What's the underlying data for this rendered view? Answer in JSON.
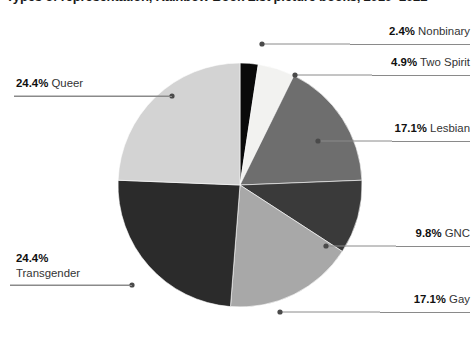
{
  "chart_data": {
    "type": "pie",
    "title": "Types of representation, Rainbow Book List picture books, 2010–2022",
    "xlabel": "",
    "ylabel": "",
    "legend_position": "none",
    "grid": false,
    "units": "percent",
    "start_angle_deg": 0,
    "direction": "clockwise",
    "categories": [
      "Nonbinary",
      "Two Spirit",
      "Lesbian",
      "GNC",
      "Gay",
      "Transgender",
      "Queer"
    ],
    "values": [
      2.4,
      4.9,
      17.1,
      9.8,
      17.1,
      24.4,
      24.4
    ],
    "labels": [
      "2.4% Nonbinary",
      "4.9% Two Spirit",
      "17.1% Lesbian",
      "9.8% GNC",
      "17.1% Gay",
      "24.4% Transgender",
      "24.4% Queer"
    ],
    "colors": [
      "#0a0a0a",
      "#f2f2f0",
      "#6e6e6e",
      "#3a3a3a",
      "#a8a8a8",
      "#2b2b2b",
      "#d3d3d3"
    ],
    "slices": [
      {
        "name": "Nonbinary",
        "percent": "2.4%",
        "label": "Nonbinary",
        "value": 2.4,
        "color": "#0a0a0a"
      },
      {
        "name": "Two Spirit",
        "percent": "4.9%",
        "label": "Two Spirit",
        "value": 4.9,
        "color": "#f2f2f0"
      },
      {
        "name": "Lesbian",
        "percent": "17.1%",
        "label": "Lesbian",
        "value": 17.1,
        "color": "#6e6e6e"
      },
      {
        "name": "GNC",
        "percent": "9.8%",
        "label": "GNC",
        "value": 9.8,
        "color": "#3a3a3a"
      },
      {
        "name": "Gay",
        "percent": "17.1%",
        "label": "Gay",
        "value": 17.1,
        "color": "#a8a8a8"
      },
      {
        "name": "Transgender",
        "percent": "24.4%",
        "label": "Transgender",
        "value": 24.4,
        "color": "#2b2b2b"
      },
      {
        "name": "Queer",
        "percent": "24.4%",
        "label": "Queer",
        "value": 24.4,
        "color": "#d3d3d3"
      }
    ]
  },
  "annotations": {
    "nonbinary": {
      "percent": "2.4%",
      "name": "Nonbinary"
    },
    "two_spirit": {
      "percent": "4.9%",
      "name": "Two Spirit"
    },
    "lesbian": {
      "percent": "17.1%",
      "name": "Lesbian"
    },
    "gnc": {
      "percent": "9.8%",
      "name": "GNC"
    },
    "gay": {
      "percent": "17.1%",
      "name": "Gay"
    },
    "transgender": {
      "percent": "24.4%",
      "name": "Transgender"
    },
    "queer": {
      "percent": "24.4%",
      "name": "Queer"
    }
  },
  "style": {
    "leader_color": "#8a8a8a",
    "text_color": "#333333",
    "emphasis_color": "#101010",
    "background": "#ffffff"
  }
}
